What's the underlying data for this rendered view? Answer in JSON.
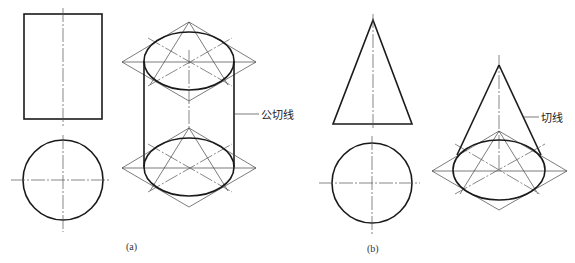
{
  "figure": {
    "panel_a": {
      "caption": "(a)",
      "subject": "cylinder",
      "views": [
        "front-view-rectangle",
        "top-view-circle",
        "isometric-cylinder"
      ],
      "callout": "公切线"
    },
    "panel_b": {
      "caption": "(b)",
      "subject": "cone",
      "views": [
        "front-view-triangle",
        "top-view-circle",
        "isometric-cone"
      ],
      "callout": "切线"
    }
  },
  "colors": {
    "background": "#ffffff",
    "outline": "#1a1a1a",
    "construction": "#444444"
  }
}
